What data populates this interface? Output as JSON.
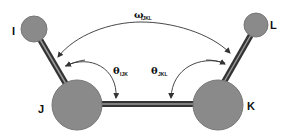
{
  "diagram": {
    "atoms": [
      {
        "id": "I",
        "label": "I",
        "cx": 34,
        "cy": 29,
        "r": 13
      },
      {
        "id": "J",
        "label": "J",
        "cx": 77,
        "cy": 105,
        "r": 26
      },
      {
        "id": "K",
        "label": "K",
        "cx": 218,
        "cy": 105,
        "r": 26
      },
      {
        "id": "L",
        "label": "L",
        "cx": 256,
        "cy": 25,
        "r": 12
      }
    ],
    "bonds": [
      {
        "from": "I",
        "to": "J"
      },
      {
        "from": "J",
        "to": "K"
      },
      {
        "from": "K",
        "to": "L"
      }
    ],
    "angles": {
      "omega": {
        "symbol": "ω",
        "subscript": "IJKL"
      },
      "theta_ijk": {
        "symbol": "θ",
        "subscript": "IJK"
      },
      "theta_jkl": {
        "symbol": "θ",
        "subscript": "JKL"
      }
    },
    "colors": {
      "atom_fill": "#8a8a8a",
      "atom_stroke": "#6e6e6e",
      "bond": "#3a3a3a",
      "arrow": "#333333",
      "text": "#111111"
    }
  }
}
